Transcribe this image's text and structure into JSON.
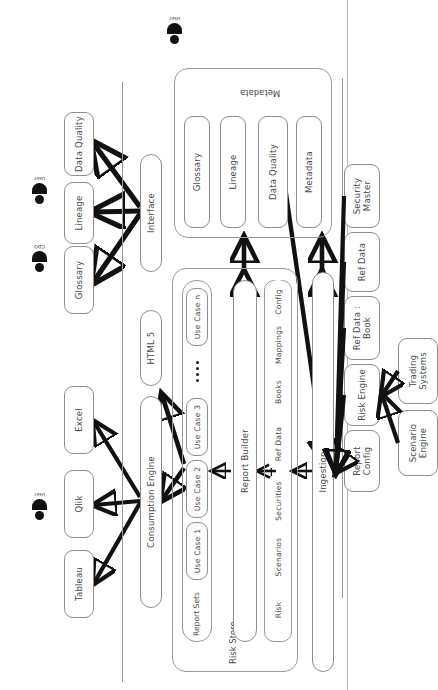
{
  "diagram": {
    "actors": [
      {
        "name": "user-top-left",
        "label": "User"
      },
      {
        "name": "cdo",
        "label": "CDO"
      },
      {
        "name": "user-top-right",
        "label": "User"
      },
      {
        "name": "user-bottom",
        "label": "User"
      }
    ],
    "consumers": [
      {
        "label": "Tableau"
      },
      {
        "label": "Qlik"
      },
      {
        "label": "Excel"
      },
      {
        "label": "Glossary"
      },
      {
        "label": "Lineage"
      },
      {
        "label": "Data Quality"
      }
    ],
    "services": [
      {
        "label": "Consumption Engine"
      },
      {
        "label": "HTML 5"
      },
      {
        "label": "Interface"
      }
    ],
    "risk_store": {
      "label": "Risk Store",
      "report_sets": {
        "label": "Report Sets",
        "use_cases": [
          "Use Case 1",
          "Use Case 2",
          "Use Case 3",
          "Use Case n"
        ],
        "ellipsis": "...."
      },
      "report_builder": {
        "label": "Report Builder"
      },
      "data_domains": [
        "Risk",
        "Scenarios",
        "Securities",
        "Ref Data",
        "Books",
        "Mappings",
        "Config"
      ]
    },
    "metadata": {
      "label": "Metadata",
      "items": [
        "Glossary",
        "Lineage",
        "Data Quality",
        "Metadata"
      ]
    },
    "ingestion": {
      "label": "Ingestion"
    },
    "sources": [
      {
        "label": "Security Master"
      },
      {
        "label": "Ref Data"
      },
      {
        "label": "Ref Data : Book"
      },
      {
        "label": "Risk Engine"
      },
      {
        "label": "Report Config"
      }
    ],
    "feeders": [
      {
        "label": "Trading Systems"
      },
      {
        "label": "Scenario Engine"
      }
    ],
    "colors": {
      "stroke": "#8e8e8e",
      "arrow": "#111111",
      "text": "#4a4a4a",
      "divider": "#9b9b9b",
      "page": "#ffffff"
    }
  }
}
